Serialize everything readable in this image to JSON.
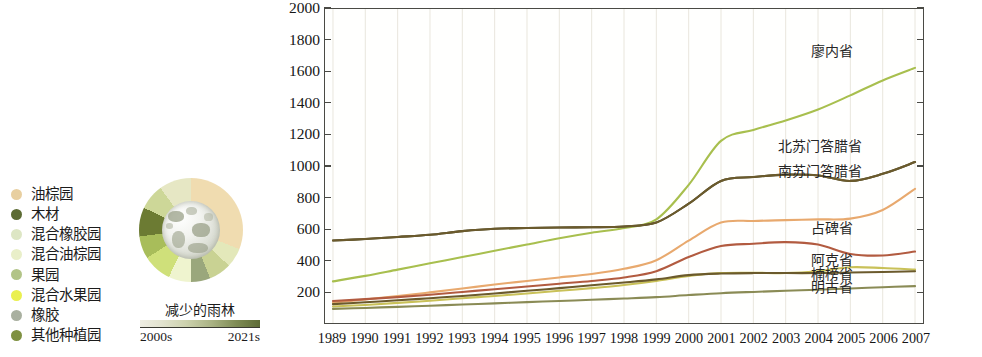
{
  "legend": {
    "items": [
      {
        "label": "油棕园",
        "color": "#e8cfa0"
      },
      {
        "label": "木材",
        "color": "#5c6b33"
      },
      {
        "label": "混合橡胶园",
        "color": "#dde6c4"
      },
      {
        "label": "混合油棕园",
        "color": "#e9efc9"
      },
      {
        "label": "果园",
        "color": "#b2c487"
      },
      {
        "label": "混合水果园",
        "color": "#eaf04f"
      },
      {
        "label": "橡胶",
        "color": "#a9b0a0"
      },
      {
        "label": "其他种植园",
        "color": "#7f9142"
      }
    ]
  },
  "donut": {
    "name": "rainforest-loss-donut",
    "segments": [
      {
        "color": "#f0dcb0",
        "value": 31
      },
      {
        "color": "#e3e8ba",
        "value": 6
      },
      {
        "color": "#c9d293",
        "value": 7
      },
      {
        "color": "#9aa77c",
        "value": 6
      },
      {
        "color": "#eff4cf",
        "value": 7
      },
      {
        "color": "#cfe07a",
        "value": 9
      },
      {
        "color": "#a8bd5a",
        "value": 7
      },
      {
        "color": "#6c7b33",
        "value": 9
      },
      {
        "color": "#cdd798",
        "value": 8
      },
      {
        "color": "#e6e7c4",
        "value": 10
      }
    ]
  },
  "scale": {
    "title": "减少的雨林",
    "start_label": "2000s",
    "end_label": "2021s"
  },
  "chart_data": {
    "type": "line",
    "title": "",
    "xlabel": "",
    "ylabel": "",
    "xlim": [
      1989,
      2007
    ],
    "ylim": [
      0,
      2000
    ],
    "ytick_values": [
      200,
      400,
      600,
      800,
      1000,
      1200,
      1400,
      1600,
      1800,
      2000
    ],
    "grid": "vertical",
    "legend_position": "right-inline",
    "x": [
      1989,
      1990,
      1991,
      1992,
      1993,
      1994,
      1995,
      1996,
      1997,
      1998,
      1999,
      2000,
      2001,
      2002,
      2003,
      2004,
      2005,
      2006,
      2007
    ],
    "series": [
      {
        "name": "廖内省",
        "color": "#a8bf4e",
        "label_x": 2004,
        "label_y": 1720,
        "values": [
          265,
          300,
          340,
          380,
          420,
          460,
          500,
          540,
          575,
          605,
          660,
          880,
          1160,
          1230,
          1290,
          1360,
          1450,
          1545,
          1625
        ]
      },
      {
        "name": "北苏门答腊省",
        "color": "#4e4d2e",
        "label_x": 2003,
        "label_y": 1120,
        "values": [
          525,
          535,
          548,
          562,
          585,
          600,
          605,
          608,
          610,
          615,
          640,
          760,
          905,
          930,
          945,
          940,
          905,
          950,
          1025
        ]
      },
      {
        "name": "南苏门答腊省",
        "color": "#6b5a2c",
        "label_x": 2003,
        "label_y": 960,
        "values": [
          525,
          535,
          548,
          562,
          585,
          600,
          605,
          608,
          610,
          615,
          640,
          760,
          905,
          930,
          945,
          940,
          905,
          950,
          1025
        ]
      },
      {
        "name": "占碑省",
        "color": "#e8a96e",
        "label_x": 2004,
        "label_y": 600,
        "values": [
          130,
          150,
          172,
          195,
          220,
          245,
          268,
          290,
          312,
          345,
          400,
          525,
          640,
          650,
          655,
          660,
          665,
          720,
          855
        ]
      },
      {
        "name": "阿克省",
        "color": "#b25b40",
        "label_x": 2004,
        "label_y": 400,
        "values": [
          140,
          152,
          165,
          180,
          198,
          215,
          232,
          250,
          268,
          290,
          330,
          420,
          490,
          505,
          515,
          500,
          440,
          430,
          455
        ]
      },
      {
        "name": "楠榜省",
        "color": "#c9c158",
        "label_x": 2004,
        "label_y": 310,
        "values": [
          105,
          115,
          128,
          142,
          158,
          172,
          188,
          205,
          222,
          242,
          268,
          300,
          318,
          320,
          318,
          330,
          355,
          350,
          340
        ]
      },
      {
        "name": "明古省",
        "color": "#6b5a2c",
        "label_x": 2004,
        "label_y": 230,
        "values": [
          120,
          132,
          145,
          158,
          172,
          188,
          205,
          222,
          240,
          258,
          278,
          305,
          315,
          318,
          318,
          318,
          322,
          325,
          330
        ]
      },
      {
        "name": "其他",
        "color": "#8a8b55",
        "label_x": 0,
        "label_y": 0,
        "values": [
          90,
          96,
          103,
          110,
          118,
          125,
          133,
          140,
          148,
          156,
          165,
          178,
          190,
          198,
          205,
          212,
          220,
          228,
          235
        ]
      }
    ]
  }
}
